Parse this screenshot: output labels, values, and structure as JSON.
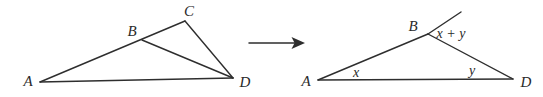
{
  "colors": {
    "line": "#2e2e2e",
    "background": "#ffffff",
    "text": "#2a2a2a"
  },
  "left": {
    "description": "triangle A C D with point B on side AC and segment B D drawn",
    "labels": {
      "A": "A",
      "B": "B",
      "C": "C",
      "D": "D"
    }
  },
  "arrow": {
    "meaning": "transforms-into arrow"
  },
  "right": {
    "description": "triangle A B D with side AB extended beyond B; interior angles x at A and y at D, exterior angle x + y at B",
    "labels": {
      "A": "A",
      "B": "B",
      "D": "D",
      "angle_at_A": "x",
      "angle_at_D": "y",
      "exterior_angle_at_B": "x + y"
    }
  }
}
